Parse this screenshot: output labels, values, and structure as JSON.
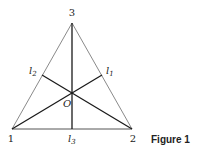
{
  "figure": {
    "caption": "Figure 1",
    "vertices": [
      {
        "label": "1",
        "x": 12,
        "y": 129
      },
      {
        "label": "2",
        "x": 132,
        "y": 129
      },
      {
        "label": "3",
        "x": 72,
        "y": 23
      }
    ],
    "center_label": "O",
    "feet": [
      {
        "label": "l",
        "sub": "1",
        "x": 102,
        "y": 75
      },
      {
        "label": "l",
        "sub": "2",
        "x": 42,
        "y": 75
      },
      {
        "label": "l",
        "sub": "3",
        "x": 72,
        "y": 129
      }
    ],
    "colors": {
      "outline": "#8a8a8a",
      "median": "#1a1a1a"
    }
  }
}
